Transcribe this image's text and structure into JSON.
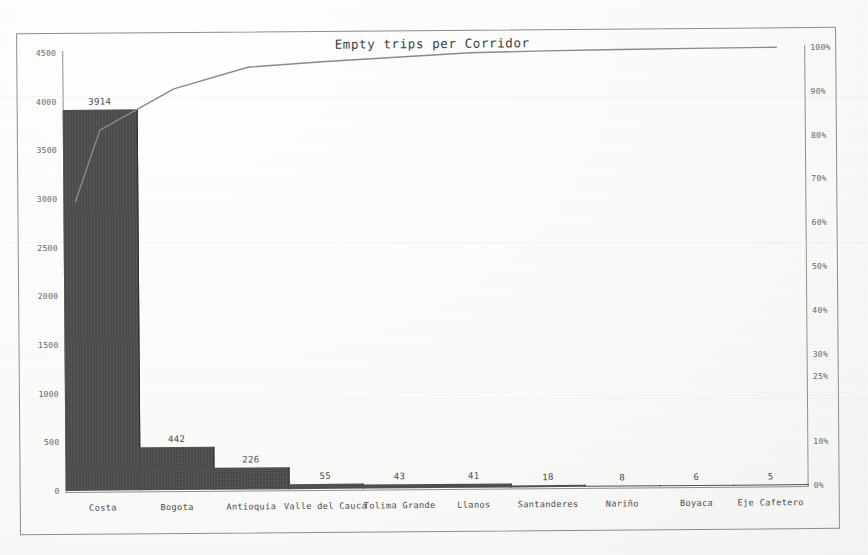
{
  "chart_data": {
    "type": "bar",
    "title": "Empty trips per Corridor",
    "xlabel": "",
    "ylabel": "",
    "categories": [
      "Costa",
      "Bogota",
      "Antioquia",
      "Valle del Cauca",
      "Tolima Grande",
      "Llanos",
      "Santanderes",
      "Nariño",
      "Boyaca",
      "Eje Cafetero"
    ],
    "values": [
      3914,
      442,
      226,
      55,
      43,
      41,
      18,
      8,
      6,
      5
    ],
    "value_labels": [
      "3914",
      "442",
      "226",
      "55",
      "43",
      "41",
      "18",
      "8",
      "6",
      "5"
    ],
    "ylim": [
      0,
      4500
    ],
    "y_ticks": [
      0,
      500,
      1000,
      1500,
      2000,
      2500,
      3000,
      3500,
      4000,
      4500
    ],
    "y_tick_labels": [
      "0",
      "500",
      "1000",
      "1500",
      "2000",
      "2500",
      "3000",
      "3500",
      "4000",
      "4500"
    ],
    "secondary_axis": {
      "label": "",
      "ylim": [
        0,
        100
      ],
      "ticks": [
        0,
        10,
        25,
        30,
        40,
        50,
        60,
        70,
        80,
        90,
        100
      ],
      "tick_labels": [
        "0%",
        "10%",
        "25%",
        "30%",
        "40%",
        "50%",
        "60%",
        "70%",
        "80%",
        "90%",
        "100%"
      ]
    },
    "series": [
      {
        "name": "Empty trips",
        "type": "bar",
        "values": [
          3914,
          442,
          226,
          55,
          43,
          41,
          18,
          8,
          6,
          5
        ],
        "color": "#4c4c4c"
      },
      {
        "name": "Cumulative %",
        "type": "line",
        "axis": "secondary",
        "values": [
          82.3,
          91.6,
          96.4,
          97.5,
          98.4,
          99.3,
          99.6,
          99.8,
          99.9,
          100.0
        ],
        "color": "#8a8a8a"
      }
    ],
    "grid": false,
    "legend": "none",
    "total": 4758
  },
  "style": {
    "bar_color": "#4c4c4c",
    "line_color": "#8a8a8a",
    "frame_color": "#8d8d8d",
    "text_color": "#4a4a4a",
    "tick_color": "#666666",
    "background": "#ffffff"
  }
}
